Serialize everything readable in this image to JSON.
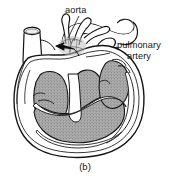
{
  "figure": {
    "caption": "(b)",
    "background_color": "#ffffff",
    "ink_color": "#141414",
    "chamber_fill_color": "#a8a8a8",
    "wall_fill_color": "#ffffff",
    "arrow_color": "#0d0d0d"
  },
  "labels": {
    "aorta": "aorta",
    "pulmonary_line1": "pulmonary",
    "pulmonary_line2": "artery"
  },
  "icons": {
    "flow_arrow": "black-arrow-icon",
    "aorta_leader": "leader-line-icon",
    "pulmonary_leader": "leader-line-icon"
  }
}
